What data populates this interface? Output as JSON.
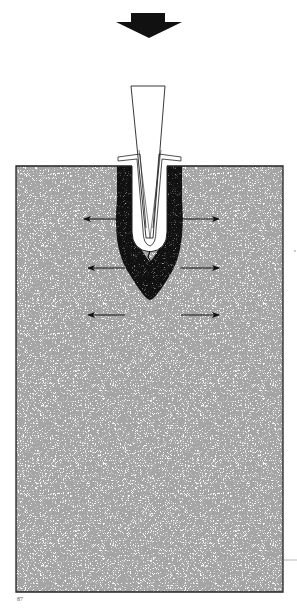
{
  "diagram": {
    "colors": {
      "ink": "#111111",
      "block_fill": "#fbfbfb",
      "stipple": "#7a7a7a",
      "background": "#ffffff"
    },
    "force_arrow": {
      "direction": "down",
      "icon": "thick-down-arrow"
    },
    "wedge": {
      "shape": "tapered-trapezoid",
      "label": ""
    },
    "block": {
      "shape": "rectangle",
      "texture": "stippled"
    },
    "stress_arrows": {
      "left": [
        "outward",
        "outward",
        "outward"
      ],
      "right": [
        "outward",
        "outward",
        "outward"
      ]
    },
    "crack": {
      "present": true
    }
  },
  "footer": {
    "page_number": "87"
  }
}
